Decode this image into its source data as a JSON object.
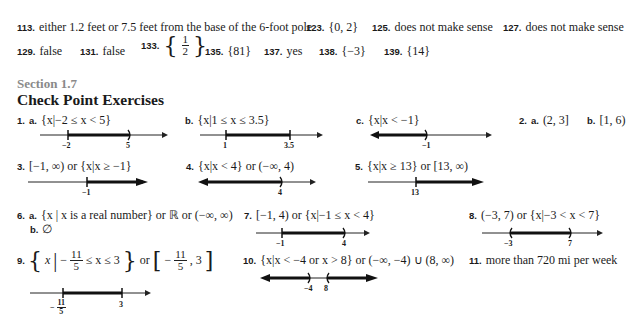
{
  "top_answers": {
    "row1": [
      {
        "num": "113.",
        "text": "either 1.2 feet or 7.5 feet from the base of the 6-foot pole"
      },
      {
        "num": "123.",
        "text": "{0, 2}"
      },
      {
        "num": "125.",
        "text": "does not make sense"
      },
      {
        "num": "127.",
        "text": "does not make sense"
      }
    ],
    "row2": [
      {
        "num": "129.",
        "text": "false"
      },
      {
        "num": "131.",
        "text": "false"
      },
      {
        "num": "133.",
        "frac_num": "1",
        "frac_den": "2"
      },
      {
        "num": "135.",
        "text": "{81}"
      },
      {
        "num": "137.",
        "text": "yes"
      },
      {
        "num": "138.",
        "text": "{−3}"
      },
      {
        "num": "139.",
        "text": "{14}"
      }
    ]
  },
  "section": {
    "label": "Section 1.7",
    "heading": "Check Point Exercises"
  },
  "exercises": {
    "e1a": {
      "num": "1.",
      "part": "a.",
      "text": "{x|−2 ≤ x < 5}",
      "labels": [
        "−2",
        "5"
      ]
    },
    "e1b": {
      "part": "b.",
      "text": "{x|1 ≤ x ≤ 3.5}",
      "labels": [
        "1",
        "3.5"
      ]
    },
    "e1c": {
      "part": "c.",
      "text": "{x|x < −1}",
      "labels": [
        "−1"
      ]
    },
    "e2a": {
      "num": "2.",
      "part": "a.",
      "text": "(2, 3]"
    },
    "e2b": {
      "part": "b.",
      "text": "[1, 6)"
    },
    "e3": {
      "num": "3.",
      "text": "[−1, ∞) or {x|x ≥ −1}",
      "labels": [
        "−1"
      ]
    },
    "e4": {
      "num": "4.",
      "text": "{x|x < 4} or (−∞, 4)",
      "labels": [
        "4"
      ]
    },
    "e5": {
      "num": "5.",
      "text": "{x|x ≥ 13} or [13, ∞)",
      "labels": [
        "13"
      ]
    },
    "e6a": {
      "num": "6.",
      "part": "a.",
      "text": "{x | x is a real number} or ℝ or (−∞, ∞)"
    },
    "e6b": {
      "part": "b.",
      "text": "∅"
    },
    "e7": {
      "num": "7.",
      "text": "[−1, 4) or {x|−1 ≤ x < 4}",
      "labels": [
        "−1",
        "4"
      ]
    },
    "e8": {
      "num": "8.",
      "text": "(−3, 7) or {x|−3 < x < 7}",
      "labels": [
        "−3",
        "7"
      ]
    },
    "e9": {
      "num": "9.",
      "text_pre": "x",
      "frac_num": "11",
      "frac_den": "5",
      "text_mid": "≤ x ≤ 3",
      "text_or": "or",
      "text_int_end": ", 3",
      "labels": [
        "3"
      ],
      "label_frac_num": "11",
      "label_frac_den": "5"
    },
    "e10": {
      "num": "10.",
      "text": "{x|x < −4 or x > 8} or (−∞, −4) ∪ (8, ∞)",
      "labels": [
        "−4",
        "8"
      ]
    },
    "e11": {
      "num": "11.",
      "text": "more than 720 mi per week"
    }
  }
}
